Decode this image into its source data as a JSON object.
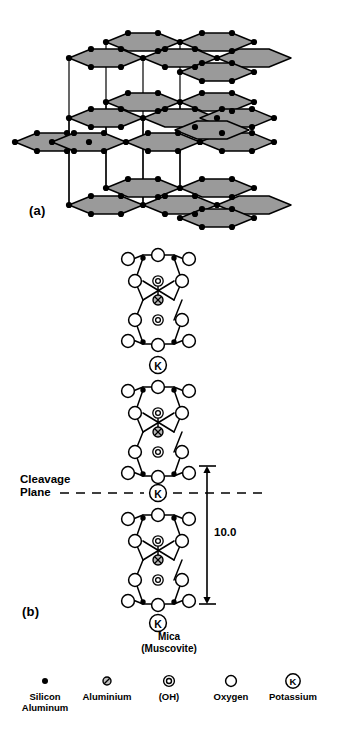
{
  "figure": {
    "panels": [
      {
        "id": "a",
        "label": "(a)",
        "description": "Three-dimensional silicate sheet lattice"
      },
      {
        "id": "b",
        "label": "(b)",
        "description": "Cross-section of muscovite mica layers"
      }
    ]
  },
  "panel_a": {
    "label": "(a)",
    "sheet_fill": "#9a9a9a",
    "line_color": "#000000",
    "vertex_color": "#000000",
    "layers": 3
  },
  "panel_b": {
    "label": "(b)",
    "cleavage_label_line1": "Cleavage",
    "cleavage_label_line2": "Plane",
    "dimension_value": "10.0",
    "mineral_name": "Mica",
    "mineral_variety": "(Muscovite)",
    "interlayer_ion": "K",
    "sheet_count": 3,
    "potassium_count": 3
  },
  "legend": {
    "items": [
      {
        "icon": "silicon-aluminum-dot-icon",
        "label": "Silicon\nAluminum"
      },
      {
        "icon": "aluminium-slashed-circle-icon",
        "label": "Aluminium"
      },
      {
        "icon": "hydroxyl-double-circle-icon",
        "label": "(OH)"
      },
      {
        "icon": "oxygen-open-circle-icon",
        "label": "Oxygen"
      },
      {
        "icon": "potassium-k-circle-icon",
        "label": "Potassium"
      }
    ]
  },
  "colors": {
    "background": "#ffffff",
    "ink": "#000000",
    "hexagon_fill": "#9a9a9a"
  }
}
